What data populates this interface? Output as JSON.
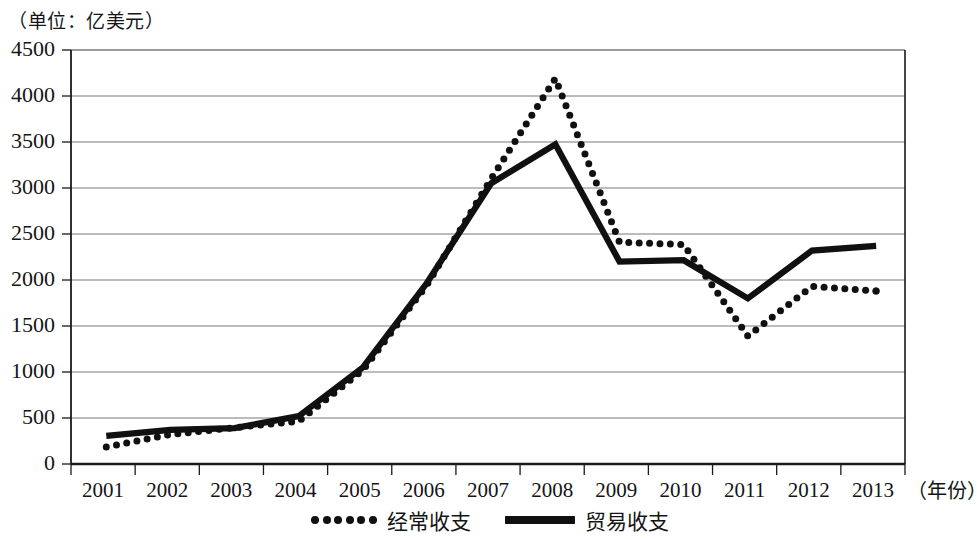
{
  "unit_note": "（单位：亿美元）",
  "axis": {
    "x_title": "（年份）",
    "y_ticks": [
      "4500",
      "4000",
      "3500",
      "3000",
      "2500",
      "2000",
      "1500",
      "1000",
      "500",
      "0"
    ],
    "x_ticks": [
      "2001",
      "2002",
      "2003",
      "2004",
      "2005",
      "2006",
      "2007",
      "2008",
      "2009",
      "2010",
      "2011",
      "2012",
      "2013"
    ]
  },
  "legend": {
    "items": [
      {
        "label": "经常收支",
        "style": "dotted"
      },
      {
        "label": "贸易收支",
        "style": "solid"
      }
    ]
  },
  "colors": {
    "line": "#101010",
    "grid": "#7b7b7b",
    "axis": "#1a1a1a",
    "background": "#ffffff"
  },
  "chart_data": {
    "type": "line",
    "title": "",
    "subtitle": "",
    "xlabel": "（年份）",
    "ylabel": "（单位：亿美元）",
    "x": [
      2001,
      2002,
      2003,
      2004,
      2005,
      2006,
      2007,
      2008,
      2009,
      2010,
      2011,
      2012,
      2013
    ],
    "categories": [
      "2001",
      "2002",
      "2003",
      "2004",
      "2005",
      "2006",
      "2007",
      "2008",
      "2009",
      "2010",
      "2011",
      "2012",
      "2013"
    ],
    "xlim": [
      2001,
      2013
    ],
    "ylim": [
      0,
      4500
    ],
    "y_ticks": [
      0,
      500,
      1000,
      1500,
      2000,
      2500,
      3000,
      3500,
      4000,
      4500
    ],
    "grid": true,
    "legend_position": "bottom",
    "series": [
      {
        "name": "经常收支",
        "style": "dotted",
        "values": [
          185,
          320,
          395,
          465,
          1020,
          1950,
          3100,
          4190,
          2410,
          2385,
          1390,
          1930,
          1880
        ]
      },
      {
        "name": "贸易收支",
        "style": "solid",
        "values": [
          305,
          370,
          390,
          520,
          1050,
          1970,
          3050,
          3475,
          2200,
          2215,
          1800,
          2320,
          2370
        ]
      }
    ]
  }
}
